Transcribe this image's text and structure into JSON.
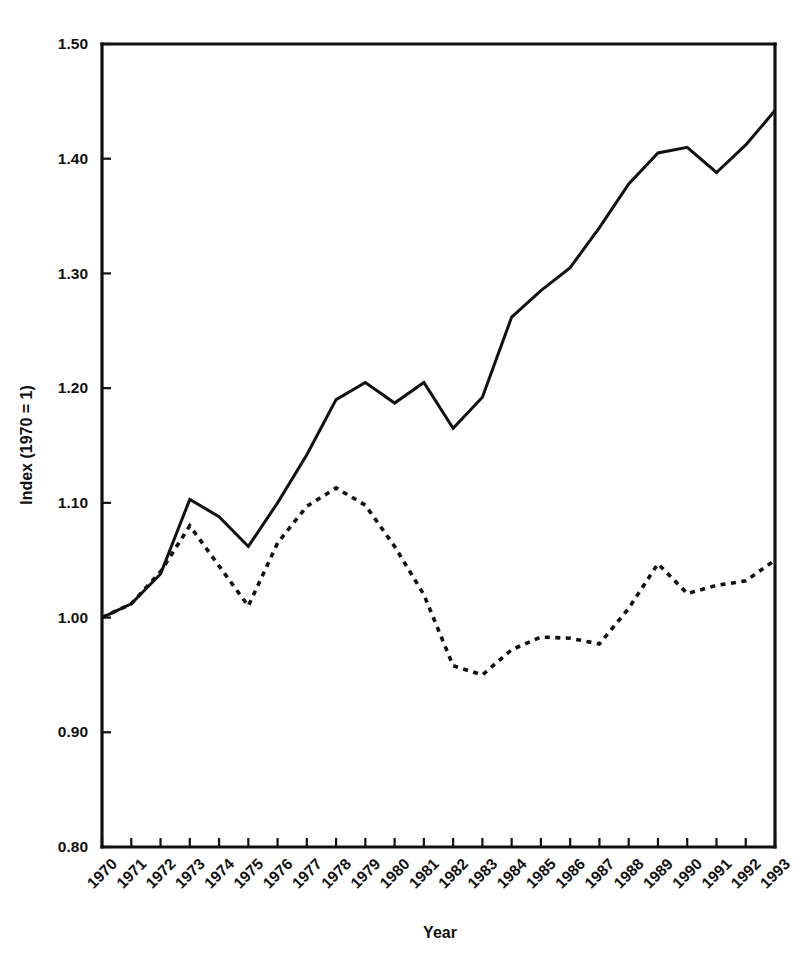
{
  "chart_data": {
    "type": "line",
    "title": "",
    "xlabel": "Year",
    "ylabel": "Index (1970 = 1)",
    "grid": false,
    "legend": "none",
    "xlim": [
      1970,
      1993
    ],
    "ylim": [
      0.8,
      1.5
    ],
    "y_ticks": [
      "1.50",
      "1.40",
      "1.30",
      "1.20",
      "1.10",
      "1.00",
      "0.90",
      "0.80"
    ],
    "y_tick_values": [
      1.5,
      1.4,
      1.3,
      1.2,
      1.1,
      1.0,
      0.9,
      0.8
    ],
    "categories": [
      "1970",
      "1971",
      "1972",
      "1973",
      "1974",
      "1975",
      "1976",
      "1977",
      "1978",
      "1979",
      "1980",
      "1981",
      "1982",
      "1983",
      "1984",
      "1985",
      "1986",
      "1987",
      "1988",
      "1989",
      "1990",
      "1991",
      "1992",
      "1993"
    ],
    "x": [
      1970,
      1971,
      1972,
      1973,
      1974,
      1975,
      1976,
      1977,
      1978,
      1979,
      1980,
      1981,
      1982,
      1983,
      1984,
      1985,
      1986,
      1987,
      1988,
      1989,
      1990,
      1991,
      1992,
      1993
    ],
    "series": [
      {
        "name": "solid-series",
        "style": "solid",
        "color": "#111111",
        "values": [
          1.0,
          1.012,
          1.038,
          1.103,
          1.088,
          1.062,
          1.1,
          1.142,
          1.19,
          1.205,
          1.187,
          1.205,
          1.165,
          1.192,
          1.262,
          1.285,
          1.305,
          1.34,
          1.378,
          1.405,
          1.41,
          1.388,
          1.412,
          1.442
        ]
      },
      {
        "name": "dashed-series",
        "style": "dashed",
        "color": "#111111",
        "values": [
          1.0,
          1.012,
          1.04,
          1.08,
          1.045,
          1.01,
          1.065,
          1.097,
          1.113,
          1.098,
          1.062,
          1.02,
          0.958,
          0.95,
          0.972,
          0.983,
          0.982,
          0.977,
          1.008,
          1.047,
          1.021,
          1.028,
          1.032,
          1.05
        ]
      }
    ]
  },
  "axes": {
    "x_title": "Year",
    "y_title": "Index (1970 = 1)"
  }
}
